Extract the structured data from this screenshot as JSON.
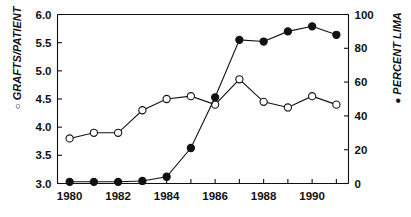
{
  "chart_data": {
    "type": "line",
    "title": "",
    "xlabel": "",
    "ylabel": "GRAFTS/PATIENT",
    "ylabel_right": "PERCENT LIMA",
    "grid": false,
    "legend": "axis-labels",
    "x": [
      1980,
      1981,
      1982,
      1983,
      1984,
      1985,
      1986,
      1987,
      1988,
      1989,
      1990,
      1991
    ],
    "xlim": [
      1979.5,
      1991.5
    ],
    "xtick_values": [
      1980,
      1981,
      1982,
      1983,
      1984,
      1985,
      1986,
      1987,
      1988,
      1989,
      1990,
      1991
    ],
    "xtick_labels": [
      "1980",
      "",
      "1982",
      "",
      "1984",
      "",
      "1986",
      "",
      "1988",
      "",
      "1990",
      ""
    ],
    "ylim": [
      3.0,
      6.0
    ],
    "ytick_values": [
      3.0,
      3.5,
      4.0,
      4.5,
      5.0,
      5.5,
      6.0
    ],
    "ytick_labels": [
      "3.0",
      "3.5",
      "4.0",
      "4.5",
      "5.0",
      "5.5",
      "6.0"
    ],
    "ylim_right": [
      0,
      100
    ],
    "ytick_values_right": [
      0,
      20,
      40,
      60,
      80,
      100
    ],
    "ytick_labels_right": [
      "0",
      "20",
      "40",
      "60",
      "80",
      "100"
    ],
    "series": [
      {
        "name": "GRAFTS/PATIENT",
        "marker": "open-circle",
        "axis": "left",
        "values": [
          3.8,
          3.9,
          3.9,
          4.3,
          4.5,
          4.55,
          4.4,
          4.85,
          4.45,
          4.35,
          4.55,
          4.4
        ]
      },
      {
        "name": "PERCENT LIMA",
        "marker": "filled-circle",
        "axis": "right",
        "values": [
          1,
          1,
          1,
          1.5,
          4,
          21,
          51,
          85,
          84,
          90,
          93,
          88
        ]
      }
    ],
    "colors": {
      "axis": "#111111",
      "line": "#111111",
      "open_marker_fill": "#ffffff",
      "filled_marker_fill": "#111111",
      "background": "#ffffff"
    }
  },
  "labels": {
    "left_axis_marker": "○",
    "left_axis_title": "GRAFTS/PATIENT",
    "right_axis_marker": "●",
    "right_axis_title": "PERCENT LIMA"
  }
}
